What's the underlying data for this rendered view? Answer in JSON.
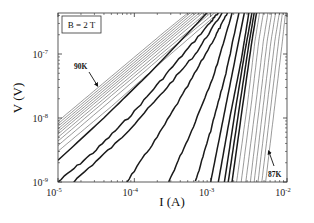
{
  "chart_data": {
    "type": "line",
    "title": "",
    "xlabel": "I (A)",
    "ylabel": "V (V)",
    "xscale": "log",
    "yscale": "log",
    "xlim": [
      1e-05,
      0.01
    ],
    "ylim": [
      1e-09,
      4.4e-07
    ],
    "x_ticks": [
      {
        "value": -5,
        "label": "10",
        "exp": "-5"
      },
      {
        "value": -4,
        "label": "10",
        "exp": "-4"
      },
      {
        "value": -3,
        "label": "10",
        "exp": "-3"
      },
      {
        "value": -2,
        "label": "10",
        "exp": "-2"
      }
    ],
    "y_ticks": [
      {
        "value": -9,
        "label": "10",
        "exp": "-9"
      },
      {
        "value": -8,
        "label": "10",
        "exp": "-8"
      },
      {
        "value": -7,
        "label": "10",
        "exp": "-7"
      }
    ],
    "grid": false,
    "legend": {
      "text": "B = 2 T",
      "position": "upper-left"
    },
    "annotations": [
      {
        "text": "90K",
        "x_px": 74,
        "y_px": 69,
        "arrow_from": [
          89,
          72
        ],
        "arrow_to": [
          97,
          85
        ]
      },
      {
        "text": "87K",
        "x_px": 268,
        "y_px": 177,
        "arrow_from": [
          274,
          166
        ],
        "arrow_to": [
          269,
          152
        ]
      }
    ],
    "temperature_range": {
      "high": "90K",
      "low": "87K"
    },
    "series_note": "Isotherms of V–I curves (log10 values), from 90K (upper-left, ohmic) to 87K (lower-right, steep)",
    "series": [
      {
        "name": "T1 (90K)",
        "weight": "thin",
        "points": [
          [
            -5,
            -8.05
          ],
          [
            -4.3,
            -7.35
          ],
          [
            -3.6,
            -6.65
          ],
          [
            -3.3,
            -6.36
          ]
        ]
      },
      {
        "name": "T2",
        "weight": "thin",
        "points": [
          [
            -5,
            -8.09
          ],
          [
            -4.3,
            -7.39
          ],
          [
            -3.6,
            -6.69
          ],
          [
            -3.27,
            -6.36
          ]
        ]
      },
      {
        "name": "T3",
        "weight": "thin",
        "points": [
          [
            -5,
            -8.13
          ],
          [
            -4.3,
            -7.43
          ],
          [
            -3.6,
            -6.73
          ],
          [
            -3.23,
            -6.36
          ]
        ]
      },
      {
        "name": "T4",
        "weight": "thin",
        "points": [
          [
            -5,
            -8.17
          ],
          [
            -4.3,
            -7.47
          ],
          [
            -3.6,
            -6.77
          ],
          [
            -3.19,
            -6.36
          ]
        ]
      },
      {
        "name": "T5",
        "weight": "thin",
        "points": [
          [
            -5,
            -8.21
          ],
          [
            -4.3,
            -7.51
          ],
          [
            -3.6,
            -6.81
          ],
          [
            -3.15,
            -6.36
          ]
        ]
      },
      {
        "name": "T6",
        "weight": "thin",
        "points": [
          [
            -5,
            -8.25
          ],
          [
            -4.3,
            -7.55
          ],
          [
            -3.6,
            -6.85
          ],
          [
            -3.11,
            -6.36
          ]
        ]
      },
      {
        "name": "T7",
        "weight": "thin",
        "points": [
          [
            -5,
            -8.3
          ],
          [
            -4.3,
            -7.6
          ],
          [
            -3.6,
            -6.9
          ],
          [
            -3.06,
            -6.36
          ]
        ]
      },
      {
        "name": "T8",
        "weight": "thin",
        "points": [
          [
            -5,
            -8.36
          ],
          [
            -4.3,
            -7.65
          ],
          [
            -3.6,
            -6.95
          ],
          [
            -3.0,
            -6.36
          ]
        ]
      },
      {
        "name": "T9",
        "weight": "thin",
        "points": [
          [
            -5,
            -8.43
          ],
          [
            -4.3,
            -7.72
          ],
          [
            -3.6,
            -7.0
          ],
          [
            -2.95,
            -6.36
          ]
        ]
      },
      {
        "name": "T10",
        "weight": "thin",
        "points": [
          [
            -5,
            -8.52
          ],
          [
            -4.3,
            -7.82
          ],
          [
            -3.6,
            -7.08
          ],
          [
            -2.9,
            -6.36
          ]
        ]
      },
      {
        "name": "T11",
        "weight": "thick",
        "points": [
          [
            -5,
            -8.66
          ],
          [
            -4.4,
            -8.0
          ],
          [
            -3.8,
            -7.3
          ],
          [
            -3.2,
            -6.55
          ],
          [
            -3.05,
            -6.36
          ]
        ]
      },
      {
        "name": "T12",
        "weight": "thick",
        "points": [
          [
            -5,
            -9.0
          ],
          [
            -4.5,
            -8.5
          ],
          [
            -4.0,
            -7.9
          ],
          [
            -3.5,
            -7.2
          ],
          [
            -3.0,
            -6.5
          ],
          [
            -2.9,
            -6.36
          ]
        ]
      },
      {
        "name": "T13",
        "weight": "thick",
        "points": [
          [
            -4.8,
            -9.0
          ],
          [
            -4.2,
            -8.35
          ],
          [
            -3.7,
            -7.7
          ],
          [
            -3.2,
            -7.0
          ],
          [
            -2.85,
            -6.36
          ]
        ]
      },
      {
        "name": "T14",
        "weight": "thick",
        "points": [
          [
            -4.1,
            -9.0
          ],
          [
            -3.7,
            -8.3
          ],
          [
            -3.3,
            -7.5
          ],
          [
            -2.95,
            -6.75
          ],
          [
            -2.78,
            -6.36
          ]
        ]
      },
      {
        "name": "T15",
        "weight": "thick",
        "points": [
          [
            -3.55,
            -9.0
          ],
          [
            -3.25,
            -8.2
          ],
          [
            -2.95,
            -7.3
          ],
          [
            -2.72,
            -6.36
          ]
        ]
      },
      {
        "name": "T16",
        "weight": "thick",
        "points": [
          [
            -3.2,
            -9.0
          ],
          [
            -3.0,
            -8.2
          ],
          [
            -2.8,
            -7.3
          ],
          [
            -2.63,
            -6.36
          ]
        ]
      },
      {
        "name": "T17",
        "weight": "thick",
        "points": [
          [
            -3.0,
            -9.0
          ],
          [
            -2.85,
            -8.1
          ],
          [
            -2.7,
            -7.2
          ],
          [
            -2.56,
            -6.36
          ]
        ]
      },
      {
        "name": "T18",
        "weight": "thick",
        "points": [
          [
            -2.9,
            -9.0
          ],
          [
            -2.75,
            -8.0
          ],
          [
            -2.6,
            -7.1
          ],
          [
            -2.5,
            -6.36
          ]
        ]
      },
      {
        "name": "T19",
        "weight": "thick",
        "points": [
          [
            -2.82,
            -9.0
          ],
          [
            -2.68,
            -7.9
          ],
          [
            -2.55,
            -6.95
          ],
          [
            -2.46,
            -6.36
          ]
        ]
      },
      {
        "name": "T20",
        "weight": "thick",
        "points": [
          [
            -2.77,
            -9.0
          ],
          [
            -2.62,
            -7.8
          ],
          [
            -2.5,
            -6.85
          ],
          [
            -2.43,
            -6.36
          ]
        ]
      },
      {
        "name": "T21",
        "weight": "thick",
        "points": [
          [
            -2.72,
            -9.0
          ],
          [
            -2.58,
            -7.8
          ],
          [
            -2.46,
            -6.8
          ],
          [
            -2.4,
            -6.36
          ]
        ]
      },
      {
        "name": "T22",
        "weight": "thin",
        "points": [
          [
            -2.66,
            -9.0
          ],
          [
            -2.52,
            -7.8
          ],
          [
            -2.42,
            -6.8
          ],
          [
            -2.36,
            -6.36
          ]
        ]
      },
      {
        "name": "T23",
        "weight": "thin",
        "points": [
          [
            -2.6,
            -9.0
          ],
          [
            -2.47,
            -7.8
          ],
          [
            -2.37,
            -6.8
          ],
          [
            -2.31,
            -6.36
          ]
        ]
      },
      {
        "name": "T24",
        "weight": "thin",
        "points": [
          [
            -2.54,
            -9.0
          ],
          [
            -2.41,
            -7.8
          ],
          [
            -2.31,
            -6.8
          ],
          [
            -2.25,
            -6.36
          ]
        ]
      },
      {
        "name": "T25",
        "weight": "thin",
        "points": [
          [
            -2.48,
            -9.0
          ],
          [
            -2.36,
            -7.8
          ],
          [
            -2.26,
            -6.8
          ],
          [
            -2.2,
            -6.36
          ]
        ]
      },
      {
        "name": "T26",
        "weight": "thin",
        "points": [
          [
            -2.43,
            -9.0
          ],
          [
            -2.31,
            -7.8
          ],
          [
            -2.21,
            -6.8
          ],
          [
            -2.15,
            -6.36
          ]
        ]
      },
      {
        "name": "T27",
        "weight": "thin",
        "points": [
          [
            -2.38,
            -9.0
          ],
          [
            -2.26,
            -7.8
          ],
          [
            -2.16,
            -6.8
          ],
          [
            -2.1,
            -6.36
          ]
        ]
      },
      {
        "name": "T28",
        "weight": "thin",
        "points": [
          [
            -2.33,
            -9.0
          ],
          [
            -2.21,
            -7.8
          ],
          [
            -2.11,
            -6.8
          ],
          [
            -2.06,
            -6.36
          ]
        ]
      },
      {
        "name": "T29 (87K)",
        "weight": "thin",
        "points": [
          [
            -2.28,
            -9.0
          ],
          [
            -2.16,
            -7.8
          ],
          [
            -2.06,
            -6.8
          ],
          [
            -2.02,
            -6.36
          ]
        ]
      }
    ]
  },
  "frame": {
    "left": 58,
    "right": 287,
    "top": 13,
    "bottom": 182
  }
}
